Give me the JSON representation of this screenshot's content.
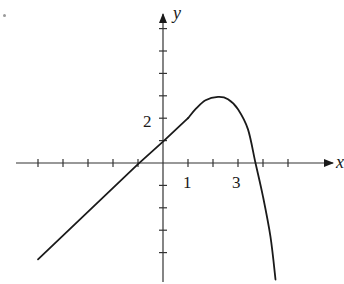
{
  "chart_data": {
    "type": "line",
    "title": "",
    "xlabel": "x",
    "ylabel": "y",
    "x_tick_labels": [
      {
        "value": 1,
        "label": "1"
      },
      {
        "value": 3,
        "label": "3"
      }
    ],
    "y_tick_labels": [
      {
        "value": 2,
        "label": "2"
      }
    ],
    "x_ticks": [
      -5,
      -4,
      -3,
      -2,
      -1,
      1,
      2,
      3,
      4,
      5
    ],
    "y_ticks": [
      -4,
      -3,
      -2,
      -1,
      1,
      2,
      3,
      4,
      5,
      6
    ],
    "xlim": [
      -5.1,
      6.9
    ],
    "ylim": [
      -5.3,
      6.6
    ],
    "grid": false,
    "legend": null,
    "series": [
      {
        "name": "f(x)",
        "segments": [
          {
            "kind": "linear",
            "points": [
              [
                -5,
                -4.3
              ],
              [
                -1,
                -0.05
              ],
              [
                0,
                0.95
              ],
              [
                1,
                2
              ]
            ]
          },
          {
            "kind": "curve",
            "points": [
              [
                1,
                2
              ],
              [
                1.3,
                2.4
              ],
              [
                1.7,
                2.8
              ],
              [
                2.2,
                2.95
              ],
              [
                2.6,
                2.85
              ],
              [
                3.0,
                2.4
              ],
              [
                3.4,
                1.5
              ],
              [
                3.7,
                0
              ],
              [
                4.0,
                -1.5
              ],
              [
                4.3,
                -3.3
              ],
              [
                4.5,
                -5.2
              ]
            ]
          }
        ]
      }
    ],
    "annotations": {
      "corner_mark": "."
    }
  },
  "labels": {
    "x_axis": "x",
    "y_axis": "y",
    "tick_1": "1",
    "tick_3": "3",
    "tick_2": "2"
  }
}
